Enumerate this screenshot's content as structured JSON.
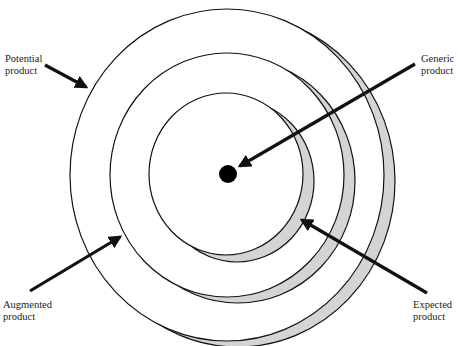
{
  "diagram": {
    "type": "concentric-levels",
    "colors": {
      "stroke": "#111111",
      "shadow": "#d4d4d4",
      "fill": "#ffffff",
      "dot": "#000000"
    },
    "levels": [
      {
        "name": "Potential product",
        "cx": 227,
        "cy": 175,
        "rx": 157,
        "ry": 166
      },
      {
        "name": "Augmented product",
        "cx": 227,
        "cy": 175,
        "rx": 117,
        "ry": 122
      },
      {
        "name": "Expected product",
        "cx": 226,
        "cy": 174,
        "rx": 77,
        "ry": 81
      },
      {
        "name": "Generic product",
        "cx": 228,
        "cy": 174,
        "r": 9
      }
    ],
    "labels": {
      "potential": {
        "line1": "Potential",
        "line2": "product"
      },
      "generic": {
        "line1": "Generic",
        "line2": "product"
      },
      "augmented": {
        "line1": "Augmented",
        "line2": "product"
      },
      "expected": {
        "line1": "Expected",
        "line2": "product"
      }
    }
  }
}
